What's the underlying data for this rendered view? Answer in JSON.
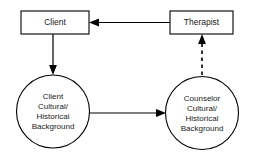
{
  "diagram": {
    "background_color": "#ffffff",
    "stroke_color": "#000000",
    "text_color": "#1a1a1a",
    "nodes": [
      {
        "id": "client-box",
        "shape": "rectangle",
        "label": "Client",
        "lines": [
          "Client"
        ]
      },
      {
        "id": "therapist-box",
        "shape": "rectangle",
        "label": "Therapist",
        "lines": [
          "Therapist"
        ]
      },
      {
        "id": "client-background-circle",
        "shape": "circle",
        "label": "Client Cultural/ Historical Background",
        "lines": [
          "Client",
          "Cultural/",
          "Historical",
          "Background"
        ]
      },
      {
        "id": "counselor-background-circle",
        "shape": "circle",
        "label": "Counselor Cultural/ Historical Background",
        "lines": [
          "Counselor",
          "Cultural/",
          "Historical",
          "Background"
        ]
      }
    ],
    "connectors": [
      {
        "id": "therapist-to-client",
        "from": "therapist-box",
        "to": "client-box",
        "style": "solid",
        "direction": "left",
        "arrowheads": 1
      },
      {
        "id": "client-to-client-background",
        "from": "client-box",
        "to": "client-background-circle",
        "style": "solid",
        "direction": "down",
        "arrowheads": 1
      },
      {
        "id": "client-background-to-counselor-background",
        "from": "client-background-circle",
        "to": "counselor-background-circle",
        "style": "solid",
        "direction": "right",
        "arrowheads": 1
      },
      {
        "id": "counselor-background-to-therapist",
        "from": "counselor-background-circle",
        "to": "therapist-box",
        "style": "dashed",
        "direction": "up",
        "arrowheads": 1
      }
    ]
  }
}
